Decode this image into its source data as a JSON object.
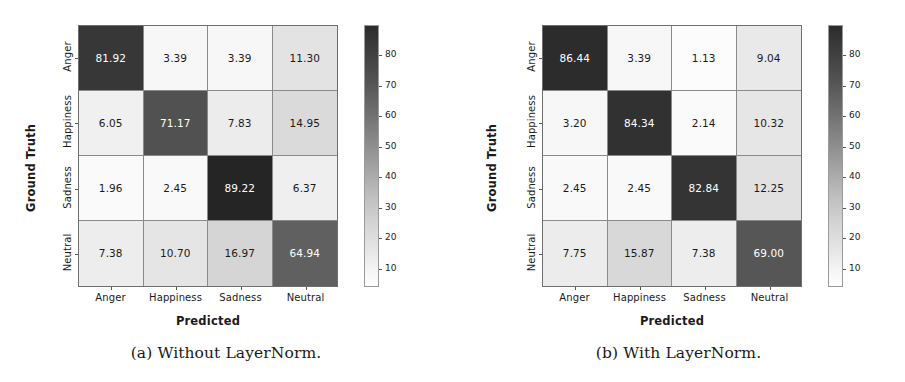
{
  "figure": {
    "panels": [
      {
        "id": "without-layernorm",
        "caption": "(a) Without LayerNorm.",
        "chart_data": {
          "type": "heatmap",
          "title": "",
          "xlabel": "Predicted",
          "ylabel": "Ground Truth",
          "categories": [
            "Anger",
            "Happiness",
            "Sadness",
            "Neutral"
          ],
          "row_labels": [
            "Anger",
            "Happiness",
            "Sadness",
            "Neutral"
          ],
          "col_labels": [
            "Anger",
            "Happiness",
            "Sadness",
            "Neutral"
          ],
          "values": [
            [
              81.92,
              3.39,
              3.39,
              11.3
            ],
            [
              6.05,
              71.17,
              7.83,
              14.95
            ],
            [
              1.96,
              2.45,
              89.22,
              6.37
            ],
            [
              7.38,
              10.7,
              16.97,
              64.94
            ]
          ],
          "cell_text": [
            [
              "81.92",
              "3.39",
              "3.39",
              "11.30"
            ],
            [
              "6.05",
              "71.17",
              "7.83",
              "14.95"
            ],
            [
              "1.96",
              "2.45",
              "89.22",
              "6.37"
            ],
            [
              "7.38",
              "10.70",
              "16.97",
              "64.94"
            ]
          ],
          "colorbar": {
            "ticks": [
              10,
              20,
              30,
              40,
              50,
              60,
              70,
              80
            ],
            "tick_labels": [
              "10",
              "20",
              "30",
              "40",
              "50",
              "60",
              "70",
              "80"
            ],
            "vmin": 1.96,
            "vmax": 89.22,
            "orientation": "vertical",
            "position": "right",
            "colormap": "greys_reversed"
          },
          "grid": true,
          "legend": "colorbar"
        }
      },
      {
        "id": "with-layernorm",
        "caption": "(b) With LayerNorm.",
        "chart_data": {
          "type": "heatmap",
          "title": "",
          "xlabel": "Predicted",
          "ylabel": "Ground Truth",
          "categories": [
            "Anger",
            "Happiness",
            "Sadness",
            "Neutral"
          ],
          "row_labels": [
            "Anger",
            "Happiness",
            "Sadness",
            "Neutral"
          ],
          "col_labels": [
            "Anger",
            "Happiness",
            "Sadness",
            "Neutral"
          ],
          "values": [
            [
              86.44,
              3.39,
              1.13,
              9.04
            ],
            [
              3.2,
              84.34,
              2.14,
              10.32
            ],
            [
              2.45,
              2.45,
              82.84,
              12.25
            ],
            [
              7.75,
              15.87,
              7.38,
              69.0
            ]
          ],
          "cell_text": [
            [
              "86.44",
              "3.39",
              "1.13",
              "9.04"
            ],
            [
              "3.20",
              "84.34",
              "2.14",
              "10.32"
            ],
            [
              "2.45",
              "2.45",
              "82.84",
              "12.25"
            ],
            [
              "7.75",
              "15.87",
              "7.38",
              "69.00"
            ]
          ],
          "colorbar": {
            "ticks": [
              10,
              20,
              30,
              40,
              50,
              60,
              70,
              80
            ],
            "tick_labels": [
              "10",
              "20",
              "30",
              "40",
              "50",
              "60",
              "70",
              "80"
            ],
            "vmin": 1.13,
            "vmax": 86.44,
            "orientation": "vertical",
            "position": "right",
            "colormap": "greys_reversed"
          },
          "grid": true,
          "legend": "colorbar"
        }
      }
    ]
  },
  "chart_data": [
    {
      "type": "heatmap",
      "title": "(a) Without LayerNorm.",
      "xlabel": "Predicted",
      "ylabel": "Ground Truth",
      "categories": [
        "Anger",
        "Happiness",
        "Sadness",
        "Neutral"
      ],
      "values": [
        [
          81.92,
          3.39,
          3.39,
          11.3
        ],
        [
          6.05,
          71.17,
          7.83,
          14.95
        ],
        [
          1.96,
          2.45,
          89.22,
          6.37
        ],
        [
          7.38,
          10.7,
          16.97,
          64.94
        ]
      ],
      "colorbar_ticks": [
        10,
        20,
        30,
        40,
        50,
        60,
        70,
        80
      ],
      "grid": true,
      "legend": "colorbar right"
    },
    {
      "type": "heatmap",
      "title": "(b) With LayerNorm.",
      "xlabel": "Predicted",
      "ylabel": "Ground Truth",
      "categories": [
        "Anger",
        "Happiness",
        "Sadness",
        "Neutral"
      ],
      "values": [
        [
          86.44,
          3.39,
          1.13,
          9.04
        ],
        [
          3.2,
          84.34,
          2.14,
          10.32
        ],
        [
          2.45,
          2.45,
          82.84,
          12.25
        ],
        [
          7.75,
          15.87,
          7.38,
          69.0
        ]
      ],
      "colorbar_ticks": [
        10,
        20,
        30,
        40,
        50,
        60,
        70,
        80
      ],
      "grid": true,
      "legend": "colorbar right"
    }
  ]
}
